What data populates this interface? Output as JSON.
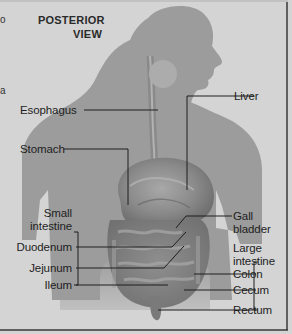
{
  "title": {
    "line1": "POSTERIOR",
    "line2": "VIEW"
  },
  "edge_fragments": [
    "o",
    "a"
  ],
  "labels": {
    "esophagus": "Esophagus",
    "liver": "Liver",
    "stomach": "Stomach",
    "small_intestine_1": "Small",
    "small_intestine_2": "intestine",
    "duodenum": "Duodenum",
    "jejunum": "Jejunum",
    "ileum": "Ileum",
    "gall_bladder_1": "Gall",
    "gall_bladder_2": "bladder",
    "large_intestine_1": "Large",
    "large_intestine_2": "intestine",
    "colon": "Colon",
    "cecum": "Cecum",
    "rectum": "Rectum"
  },
  "colors": {
    "background": "#d4d4d4",
    "silhouette": "#9c9c9c",
    "organs": "#7e7e7e",
    "leader_line": "#1e1e1e",
    "text": "#1e1e1e",
    "border": "#3a3a3a"
  }
}
